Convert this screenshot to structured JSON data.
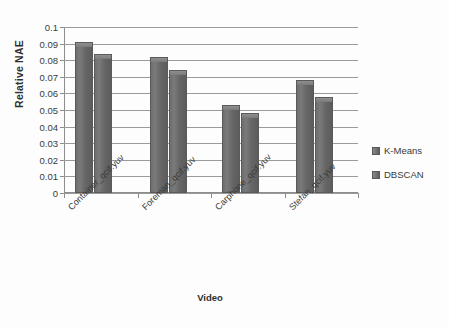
{
  "chart_data": {
    "type": "bar",
    "title": "",
    "xlabel": "Video",
    "ylabel": "Relative NAE",
    "categories": [
      "Container_qcif.yuv",
      "Foreman_qcif.yuv",
      "Carphone_qcif.yuv",
      "Stefan_qcif.yuv"
    ],
    "series": [
      {
        "name": "K-Means",
        "values": [
          0.091,
          0.082,
          0.053,
          0.068
        ]
      },
      {
        "name": "DBSCAN",
        "values": [
          0.0835,
          0.074,
          0.048,
          0.058
        ]
      }
    ],
    "ylim": [
      0,
      0.1
    ],
    "ytick_labels": [
      "0.1",
      "0.09",
      "0.08",
      "0.07",
      "0.06",
      "0.05",
      "0.04",
      "0.03",
      "0.02",
      "0.01",
      "0"
    ],
    "ytick_values": [
      0.1,
      0.09,
      0.08,
      0.07,
      0.06,
      0.05,
      0.04,
      0.03,
      0.02,
      0.01,
      0
    ],
    "grid": true,
    "legend_position": "right",
    "bar_color": "#6b6b6b",
    "grid_color": "#9a9a9a",
    "background": "#fdfdfd"
  },
  "legend": {
    "entries": [
      {
        "label": "K-Means"
      },
      {
        "label": "DBSCAN"
      }
    ]
  },
  "axes": {
    "y_title": "Relative NAE",
    "x_title": "Video"
  }
}
